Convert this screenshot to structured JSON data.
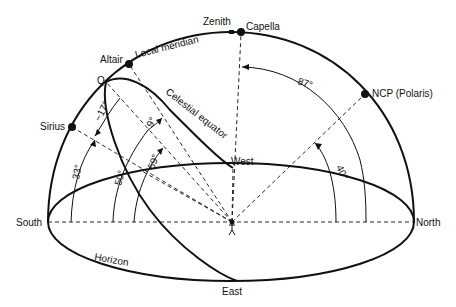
{
  "diagram": {
    "type": "celestial-sphere",
    "labels": {
      "zenith": "Zenith",
      "capella": "Capella",
      "local_meridian": "Local meridian",
      "altair": "Altair",
      "q": "Q",
      "celestial_equator": "Celestial equator",
      "sirius": "Sirius",
      "ncp": "NCP (Polaris)",
      "west": "West",
      "east": "East",
      "south": "South",
      "north": "North",
      "horizon": "Horizon"
    },
    "angles": {
      "a87": "87°",
      "a40": "40°",
      "a17": "−17°",
      "a9": "9°",
      "a59": "59°",
      "a50": "50°",
      "a33": "33°"
    },
    "colors": {
      "ink": "#111111",
      "background": "#ffffff"
    }
  }
}
